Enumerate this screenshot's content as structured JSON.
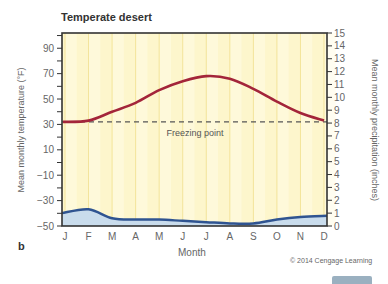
{
  "title": "Temperate desert",
  "panel_label": "b",
  "copyright": "© 2014 Cengage Learning",
  "freezing_label": "Freezing point",
  "colors": {
    "temperature": "#a3253a",
    "precipitation": "#2f5491",
    "precip_fill": "#c9dcec",
    "background": "#fdf6cc",
    "grid": "#f3e49a",
    "freezing": "#555555"
  },
  "chart_data": {
    "type": "line",
    "title": "Temperate desert",
    "xlabel": "Month",
    "ylabel": "Mean monthly temperature (°F)",
    "y2label": "Mean monthly precipitation (inches)",
    "categories": [
      "J",
      "F",
      "M",
      "A",
      "M",
      "J",
      "J",
      "A",
      "S",
      "O",
      "N",
      "D"
    ],
    "series": [
      {
        "name": "Mean monthly temperature (°F)",
        "axis": "left",
        "values": [
          32,
          33,
          40,
          47,
          57,
          64,
          68,
          66,
          58,
          48,
          39,
          33
        ]
      },
      {
        "name": "Mean monthly precipitation (inches)",
        "axis": "right",
        "type": "area",
        "values": [
          1.0,
          1.3,
          0.6,
          0.5,
          0.5,
          0.4,
          0.3,
          0.2,
          0.2,
          0.5,
          0.7,
          0.8
        ]
      }
    ],
    "annotations": [
      {
        "type": "hline",
        "y": 32,
        "label": "Freezing point"
      }
    ],
    "yticks_left": [
      90,
      70,
      50,
      30,
      10,
      -10,
      -30,
      -50
    ],
    "yticks_right": [
      15,
      14,
      13,
      12,
      11,
      10,
      9,
      8,
      7,
      6,
      5,
      4,
      3,
      2,
      1,
      0
    ],
    "ylim": [
      -50,
      102
    ],
    "y2lim": [
      0,
      15
    ],
    "grid": true
  }
}
